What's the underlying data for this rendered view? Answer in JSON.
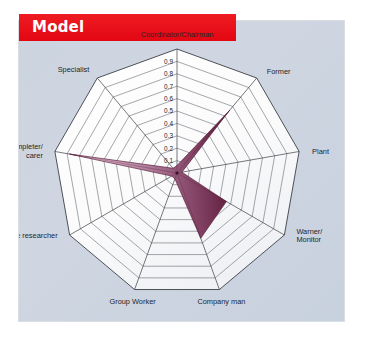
{
  "header": {
    "title": "Model",
    "banner_color": "#e30613",
    "title_color": "#ffffff"
  },
  "panel": {
    "background_color": "#ccd4e0"
  },
  "chart_data": {
    "type": "radar",
    "title": "Model",
    "xlabel": "",
    "ylabel": "",
    "grid": true,
    "legend_position": "none",
    "rlim": [
      0,
      1.0
    ],
    "tick_labels": [
      "0.1",
      "0.2",
      "0.3",
      "0.4",
      "0.5",
      "0.6",
      "0.7",
      "0.8",
      "0.9"
    ],
    "tick_values": [
      0.1,
      0.2,
      0.3,
      0.4,
      0.5,
      0.6,
      0.7,
      0.8,
      0.9
    ],
    "categories": [
      "Coordinator/Chairman",
      "Former",
      "Plant",
      "Warner/\nMonitor",
      "Company man",
      "Group Worker",
      "Source researcher",
      "Completer/\ncarer",
      "Specialist"
    ],
    "axes": [
      {
        "label": "Coordinator/Chairman",
        "label_lines": [
          "Coordinator/Chairman"
        ],
        "value": 0.06
      },
      {
        "label": "Former",
        "label_lines": [
          "Former"
        ],
        "value": 0.66
      },
      {
        "label": "Plant",
        "label_lines": [
          "Plant"
        ],
        "value": 0.04
      },
      {
        "label": "Warner/Monitor",
        "label_lines": [
          "Warner/",
          "Monitor"
        ],
        "value": 0.46
      },
      {
        "label": "Company man",
        "label_lines": [
          "Company man"
        ],
        "value": 0.56
      },
      {
        "label": "Group Worker",
        "label_lines": [
          "Group Worker"
        ],
        "value": 0.05
      },
      {
        "label": "Source researcher",
        "label_lines": [
          "Source researcher"
        ],
        "value": 0.05
      },
      {
        "label": "Completer/carer",
        "label_lines": [
          "Completer/",
          "carer"
        ],
        "value": 0.88
      },
      {
        "label": "Specialist",
        "label_lines": [
          "Specialist"
        ],
        "value": 0.05
      }
    ],
    "series": [
      {
        "name": "Model",
        "values": [
          0.06,
          0.66,
          0.04,
          0.46,
          0.56,
          0.05,
          0.05,
          0.88,
          0.05
        ],
        "fill_gradient_from": "#e9c9d8",
        "fill_gradient_to": "#6e2444"
      }
    ]
  }
}
